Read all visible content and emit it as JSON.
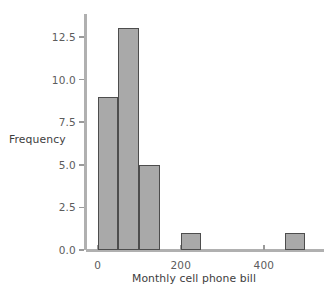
{
  "chart_data": {
    "type": "bar",
    "title": "",
    "subtitle": "",
    "xlabel": "Monthly cell phone bill",
    "ylabel": "Frequency",
    "grid": false,
    "legend": "none",
    "bin_width": 50,
    "bin_starts": [
      0,
      50,
      100,
      150,
      200,
      250,
      300,
      350,
      400,
      450
    ],
    "categories": [
      "0-50",
      "50-100",
      "100-150",
      "150-200",
      "200-250",
      "250-300",
      "300-350",
      "350-400",
      "400-450",
      "450-500"
    ],
    "values": [
      9,
      13,
      5,
      0,
      1,
      0,
      0,
      0,
      0,
      1
    ],
    "bars": [
      {
        "x0": 0,
        "x1": 50,
        "height": 9
      },
      {
        "x0": 50,
        "x1": 100,
        "height": 13
      },
      {
        "x0": 100,
        "x1": 150,
        "height": 5
      },
      {
        "x0": 200,
        "x1": 250,
        "height": 1
      },
      {
        "x0": 450,
        "x1": 500,
        "height": 1
      }
    ],
    "xlim": [
      -28,
      540
    ],
    "ylim": [
      0,
      13.85
    ],
    "xticks": [
      0,
      200,
      400
    ],
    "xtick_labels": [
      "0",
      "200",
      "400"
    ],
    "yticks": [
      0.0,
      2.5,
      5.0,
      7.5,
      10.0,
      12.5
    ],
    "ytick_labels": [
      "0.0",
      "2.5",
      "5.0",
      "7.5",
      "10.0",
      "12.5"
    ],
    "bar_fill_color": "#a9a9a9",
    "bar_edge_color": "#4d4d4d",
    "axis_color": "#b0b0b0",
    "tick_label_color": "#5c5c5c",
    "axis_title_color": "#3d3d3d",
    "background_color": "#ffffff"
  }
}
